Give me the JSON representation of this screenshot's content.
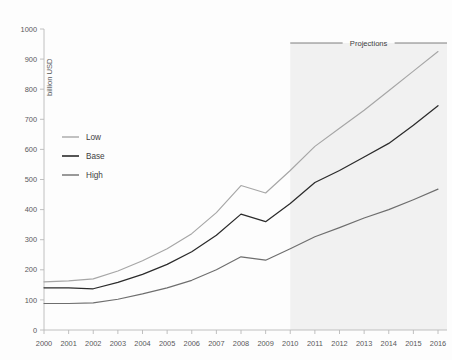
{
  "chart_data": {
    "type": "line",
    "title": "",
    "subtitle": "",
    "xlabel": "",
    "ylabel": "billion USD",
    "x": [
      2000,
      2001,
      2002,
      2003,
      2004,
      2005,
      2006,
      2007,
      2008,
      2009,
      2010,
      2011,
      2012,
      2013,
      2014,
      2015,
      2016
    ],
    "categories": [
      "2000",
      "2001",
      "2002",
      "2003",
      "2004",
      "2005",
      "2006",
      "2007",
      "2008",
      "2009",
      "2010",
      "2011",
      "2012",
      "2013",
      "2014",
      "2015",
      "2016"
    ],
    "xlim": [
      2000,
      2016
    ],
    "ylim": [
      0,
      1000
    ],
    "y_ticks": [
      0,
      100,
      200,
      300,
      400,
      500,
      600,
      700,
      800,
      900,
      1000
    ],
    "y_tick_labels": [
      "0",
      "100",
      "200",
      "300",
      "400",
      "500",
      "600",
      "700",
      "800",
      "900",
      "1000"
    ],
    "grid": false,
    "legend_position": "inside-left",
    "series": [
      {
        "name": "Low",
        "color": "#a6a6a6",
        "values": [
          160,
          163,
          170,
          196,
          230,
          270,
          320,
          390,
          480,
          455,
          530,
          610,
          670,
          730,
          795,
          860,
          925
        ]
      },
      {
        "name": "Base",
        "color": "#2b2b2b",
        "values": [
          140,
          140,
          137,
          158,
          185,
          218,
          260,
          315,
          385,
          360,
          420,
          490,
          530,
          575,
          620,
          680,
          745
        ]
      },
      {
        "name": "High",
        "color": "#6e6e6e",
        "values": [
          88,
          88,
          90,
          102,
          120,
          140,
          165,
          200,
          243,
          232,
          270,
          310,
          340,
          372,
          400,
          433,
          468
        ]
      }
    ],
    "annotations": [
      {
        "name": "projections",
        "label": "Projections",
        "type": "shaded-region-with-bracket",
        "x_start": 2010,
        "x_end": 2016,
        "shade_color": "#f1f1f1"
      }
    ]
  },
  "legend": {
    "items": [
      {
        "label": "Low",
        "color": "#a6a6a6"
      },
      {
        "label": "Base",
        "color": "#2b2b2b"
      },
      {
        "label": "High",
        "color": "#6e6e6e"
      }
    ]
  },
  "axes": {
    "y_title": "billion USD"
  }
}
